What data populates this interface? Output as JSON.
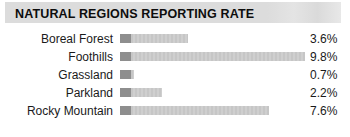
{
  "header": {
    "title": "NATURAL REGIONS REPORTING RATE",
    "band_color": "#dcdcdc"
  },
  "colors": {
    "bar_cap": "#8e8e8e",
    "bar_body": "#c9c9c9",
    "text": "#1a1a1a",
    "background": "#ffffff"
  },
  "chart_data": {
    "type": "bar",
    "orientation": "horizontal",
    "title": "NATURAL REGIONS REPORTING RATE",
    "xlabel": "",
    "ylabel": "",
    "unit": "%",
    "grid": false,
    "legend": false,
    "xlim": [
      0,
      9.8
    ],
    "categories": [
      "Boreal Forest",
      "Foothills",
      "Grassland",
      "Parkland",
      "Rocky Mountain"
    ],
    "values": [
      3.6,
      9.8,
      0.7,
      2.2,
      7.6
    ],
    "value_labels": [
      "3.6%",
      "9.8%",
      "0.7%",
      "2.2%",
      "7.6%"
    ],
    "rows": [
      {
        "label": "Boreal Forest",
        "value": 3.6,
        "value_label": "3.6%",
        "bar_pct": 36.7
      },
      {
        "label": "Foothills",
        "value": 9.8,
        "value_label": "9.8%",
        "bar_pct": 100.0
      },
      {
        "label": "Grassland",
        "value": 0.7,
        "value_label": "0.7%",
        "bar_pct": 7.6
      },
      {
        "label": "Parkland",
        "value": 2.2,
        "value_label": "2.2%",
        "bar_pct": 22.9
      },
      {
        "label": "Rocky Mountain",
        "value": 7.6,
        "value_label": "7.6%",
        "bar_pct": 80.4
      }
    ]
  }
}
